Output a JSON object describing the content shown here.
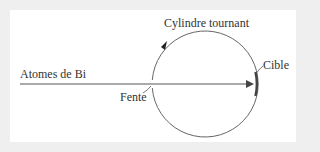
{
  "diagram": {
    "type": "experimental-setup",
    "labels": {
      "atoms": "Atomes de Bi",
      "cylinder": "Cylindre tournant",
      "target": "Cible",
      "slit": "Fente"
    },
    "colors": {
      "background": "#efefef",
      "panel": "#ffffff",
      "stroke": "#555555",
      "target": "#444444",
      "text": "#333333"
    },
    "elements": [
      {
        "id": "beam",
        "kind": "arrow",
        "label": "Atomes de Bi",
        "direction": "right"
      },
      {
        "id": "cylinder",
        "kind": "circle",
        "label": "Cylindre tournant",
        "rotation": "clockwise"
      },
      {
        "id": "slit",
        "kind": "gap-in-circle",
        "label": "Fente"
      },
      {
        "id": "target",
        "kind": "thick-arc",
        "label": "Cible"
      }
    ]
  }
}
